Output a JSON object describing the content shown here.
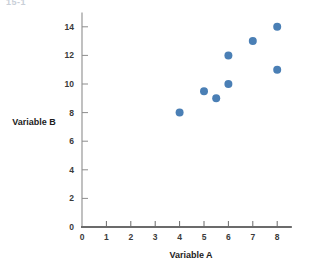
{
  "figure": {
    "top_fragment": "15-1",
    "point_color": "#4a7fb5",
    "axis_color": "#6b6b6b",
    "background": "#ffffff"
  },
  "chart_data": {
    "type": "scatter",
    "title": "",
    "xlabel": "Variable A",
    "ylabel": "Variable B",
    "xlim": [
      0,
      8.6
    ],
    "ylim": [
      0,
      15
    ],
    "xticks": [
      0,
      1,
      2,
      3,
      4,
      5,
      6,
      7,
      8
    ],
    "xtick_labels": [
      "0",
      "1",
      "2",
      "3",
      "4",
      "5",
      "6",
      "7",
      "8"
    ],
    "yticks": [
      0,
      2,
      4,
      6,
      8,
      10,
      12,
      14
    ],
    "ytick_labels": [
      "0",
      "2",
      "4",
      "6",
      "8",
      "10",
      "12",
      "14"
    ],
    "grid": false,
    "legend": false,
    "marker": "circle",
    "marker_size": 5,
    "points": [
      {
        "x": 4.0,
        "y": 8.0
      },
      {
        "x": 5.0,
        "y": 9.5
      },
      {
        "x": 5.5,
        "y": 9.0
      },
      {
        "x": 6.0,
        "y": 10.0
      },
      {
        "x": 6.0,
        "y": 12.0
      },
      {
        "x": 7.0,
        "y": 13.0
      },
      {
        "x": 8.0,
        "y": 14.0
      },
      {
        "x": 8.0,
        "y": 11.0
      }
    ]
  }
}
